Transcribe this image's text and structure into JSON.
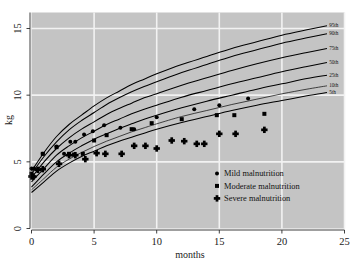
{
  "chart_data": {
    "type": "scatter",
    "title": "",
    "xlabel": "months",
    "ylabel": "kg",
    "xlim": [
      0,
      25
    ],
    "ylim": [
      0,
      16.2
    ],
    "xticks": [
      0,
      5,
      10,
      15,
      20,
      25
    ],
    "yticks": [
      0,
      5,
      10,
      15
    ],
    "grid": true,
    "grid_color": "#f2f2f2",
    "panel_color": "#c4c4c4",
    "legend_position": "bottom-right",
    "legend": [
      {
        "label": "Mild malnutrition",
        "marker": "circle"
      },
      {
        "label": "Moderate malnutrition",
        "marker": "square"
      },
      {
        "label": "Severe malnutrition",
        "marker": "plus"
      }
    ],
    "reference_curves": [
      {
        "name": "95th",
        "label": "95th",
        "x": [
          0,
          1,
          2,
          3,
          4,
          5,
          6,
          7,
          8,
          9,
          10,
          12,
          14,
          16,
          18,
          20,
          22,
          23.6
        ],
        "y": [
          4.3,
          5.7,
          6.9,
          7.8,
          8.5,
          9.2,
          9.8,
          10.3,
          10.8,
          11.2,
          11.6,
          12.3,
          12.9,
          13.5,
          14.0,
          14.5,
          14.9,
          15.2
        ]
      },
      {
        "name": "90th",
        "label": "90th",
        "x": [
          0,
          1,
          2,
          3,
          4,
          5,
          6,
          7,
          8,
          9,
          10,
          12,
          14,
          16,
          18,
          20,
          22,
          23.6
        ],
        "y": [
          4.1,
          5.4,
          6.5,
          7.4,
          8.1,
          8.7,
          9.3,
          9.8,
          10.25,
          10.65,
          11.0,
          11.7,
          12.3,
          12.9,
          13.4,
          13.9,
          14.3,
          14.6
        ]
      },
      {
        "name": "75th",
        "label": "75th",
        "x": [
          0,
          1,
          2,
          3,
          4,
          5,
          6,
          7,
          8,
          9,
          10,
          12,
          14,
          16,
          18,
          20,
          22,
          23.6
        ],
        "y": [
          3.8,
          5.0,
          6.0,
          6.8,
          7.45,
          8.0,
          8.55,
          9.0,
          9.4,
          9.8,
          10.1,
          10.75,
          11.3,
          11.85,
          12.35,
          12.8,
          13.2,
          13.5
        ]
      },
      {
        "name": "50th",
        "label": "50th",
        "x": [
          0,
          1,
          2,
          3,
          4,
          5,
          6,
          7,
          8,
          9,
          10,
          12,
          14,
          16,
          18,
          20,
          22,
          23.6
        ],
        "y": [
          3.5,
          4.5,
          5.5,
          6.2,
          6.8,
          7.3,
          7.8,
          8.2,
          8.6,
          8.95,
          9.25,
          9.85,
          10.35,
          10.85,
          11.3,
          11.75,
          12.15,
          12.45
        ]
      },
      {
        "name": "25th",
        "label": "25th",
        "x": [
          0,
          1,
          2,
          3,
          4,
          5,
          6,
          7,
          8,
          9,
          10,
          12,
          14,
          16,
          18,
          20,
          22,
          23.6
        ],
        "y": [
          3.1,
          4.1,
          5.0,
          5.65,
          6.2,
          6.7,
          7.1,
          7.5,
          7.85,
          8.2,
          8.5,
          9.05,
          9.55,
          10.0,
          10.45,
          10.85,
          11.25,
          11.5
        ]
      },
      {
        "name": "10th",
        "label": "10th",
        "x": [
          0,
          1,
          2,
          3,
          4,
          5,
          6,
          7,
          8,
          9,
          10,
          12,
          14,
          16,
          18,
          20,
          22,
          23.6
        ],
        "y": [
          2.9,
          3.75,
          4.6,
          5.2,
          5.7,
          6.15,
          6.55,
          6.9,
          7.25,
          7.55,
          7.85,
          8.4,
          8.85,
          9.3,
          9.7,
          10.1,
          10.45,
          10.7
        ]
      },
      {
        "name": "5th",
        "label": "5th",
        "x": [
          0,
          1,
          2,
          3,
          4,
          5,
          6,
          7,
          8,
          9,
          10,
          12,
          14,
          16,
          18,
          20,
          22,
          23.6
        ],
        "y": [
          2.7,
          3.5,
          4.3,
          4.9,
          5.4,
          5.8,
          6.2,
          6.55,
          6.85,
          7.15,
          7.45,
          7.95,
          8.4,
          8.85,
          9.25,
          9.6,
          9.95,
          10.2
        ]
      }
    ],
    "series": [
      {
        "name": "Mild malnutrition",
        "marker": "circle",
        "points": [
          [
            0.0,
            4.5
          ],
          [
            0.2,
            4.5
          ],
          [
            0.5,
            4.4
          ],
          [
            0.9,
            5.6
          ],
          [
            2.0,
            6.15
          ],
          [
            2.6,
            5.6
          ],
          [
            3.1,
            6.5
          ],
          [
            3.5,
            6.5
          ],
          [
            4.2,
            7.05
          ],
          [
            4.9,
            7.3
          ],
          [
            5.8,
            7.75
          ],
          [
            7.1,
            7.55
          ],
          [
            8.2,
            7.45
          ],
          [
            10.0,
            8.35
          ],
          [
            13.0,
            8.95
          ],
          [
            15.0,
            9.25
          ],
          [
            17.3,
            9.75
          ]
        ]
      },
      {
        "name": "Moderate malnutrition",
        "marker": "square",
        "points": [
          [
            0.0,
            4.1
          ],
          [
            0.9,
            5.6
          ],
          [
            2.0,
            6.1
          ],
          [
            3.0,
            5.6
          ],
          [
            3.4,
            5.55
          ],
          [
            4.1,
            5.6
          ],
          [
            5.0,
            6.6
          ],
          [
            6.0,
            7.0
          ],
          [
            8.0,
            7.45
          ],
          [
            9.6,
            7.9
          ],
          [
            12.0,
            8.2
          ],
          [
            14.8,
            8.5
          ],
          [
            16.2,
            8.5
          ],
          [
            18.6,
            8.6
          ]
        ]
      },
      {
        "name": "Severe malnutrition",
        "marker": "plus",
        "points": [
          [
            0.0,
            3.9
          ],
          [
            0.15,
            3.9
          ],
          [
            0.5,
            4.4
          ],
          [
            0.9,
            4.45
          ],
          [
            2.2,
            4.85
          ],
          [
            3.0,
            5.5
          ],
          [
            3.5,
            5.5
          ],
          [
            4.3,
            5.2
          ],
          [
            5.2,
            5.65
          ],
          [
            5.9,
            5.6
          ],
          [
            7.2,
            5.6
          ],
          [
            8.2,
            6.2
          ],
          [
            9.1,
            6.2
          ],
          [
            10.0,
            6.0
          ],
          [
            11.2,
            6.6
          ],
          [
            12.2,
            6.55
          ],
          [
            13.2,
            6.35
          ],
          [
            13.8,
            6.35
          ],
          [
            15.0,
            7.1
          ],
          [
            16.3,
            7.1
          ],
          [
            18.6,
            7.4
          ]
        ]
      }
    ]
  },
  "axes": {
    "x_label": "months",
    "y_label": "kg",
    "x_tick_labels": [
      "0",
      "5",
      "10",
      "15",
      "20",
      "25"
    ],
    "y_tick_labels": [
      "0",
      "5",
      "10",
      "15"
    ]
  },
  "percentile_labels": [
    "95th",
    "90th",
    "75th",
    "50th",
    "25th",
    "10th",
    "5th"
  ]
}
